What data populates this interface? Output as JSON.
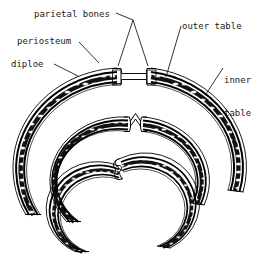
{
  "figure": {
    "kind": "anatomical-line-diagram",
    "background_color": "#ffffff",
    "ink_color": "#000000",
    "text_color": "#1a1a1a"
  },
  "labels": {
    "parietal_bones": "parietal bones",
    "periosteum": "periosteum",
    "diploe": "diploe",
    "outer_table": "outer table",
    "inner_table_line1": "inner",
    "inner_table_line2": "table"
  },
  "structures": [
    {
      "name": "outer-arch",
      "stage": "open-suture",
      "description": "largest arch, two parietal bone ends separated by a flat membranous suture band"
    },
    {
      "name": "middle-arch",
      "stage": "interdigitating-suture",
      "description": "medium arch, bone ends meet at a narrow zig-zag interlocking suture"
    },
    {
      "name": "inner-arch",
      "stage": "overlapping-suture",
      "description": "smallest arch, bone ends overlap in a wavy fused suture"
    }
  ],
  "wall_layers": [
    "periosteum",
    "outer table",
    "diploe",
    "inner table"
  ]
}
